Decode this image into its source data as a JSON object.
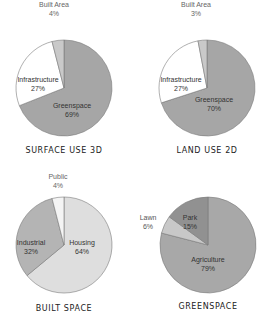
{
  "chart_data": [
    {
      "type": "pie",
      "title": "SURFACE USE 3D",
      "center": [
        64,
        88
      ],
      "radius": 48,
      "slices": [
        {
          "label": "Greenspace",
          "value": 69,
          "display": "69%",
          "color": "#a6a6a6",
          "label_pos": [
            72,
            108
          ],
          "label_color": "#333333"
        },
        {
          "label": "Infrastructure",
          "value": 27,
          "display": "27%",
          "color": "#ffffff",
          "label_pos": [
            38,
            82
          ],
          "label_color": "#333333"
        },
        {
          "label": "Built Area",
          "value": 4,
          "display": "4%",
          "color": "#c9c9c9",
          "label_pos": [
            54,
            7
          ],
          "label_color": "#666666"
        }
      ]
    },
    {
      "type": "pie",
      "title": "LAND USE 2D",
      "center": [
        207,
        88
      ],
      "radius": 48,
      "slices": [
        {
          "label": "Greenspace",
          "value": 70,
          "display": "70%",
          "color": "#a6a6a6",
          "label_pos": [
            214,
            102
          ],
          "label_color": "#333333"
        },
        {
          "label": "Infrastructure",
          "value": 27,
          "display": "27%",
          "color": "#ffffff",
          "label_pos": [
            181,
            82
          ],
          "label_color": "#333333"
        },
        {
          "label": "Built Area",
          "value": 3,
          "display": "3%",
          "color": "#c9c9c9",
          "label_pos": [
            196,
            7
          ],
          "label_color": "#666666"
        }
      ]
    },
    {
      "type": "pie",
      "title": "BUILT SPACE",
      "center": [
        64,
        245
      ],
      "radius": 48,
      "slices": [
        {
          "label": "Housing",
          "value": 64,
          "display": "64%",
          "color": "#dedede",
          "label_pos": [
            82,
            245
          ],
          "label_color": "#333333"
        },
        {
          "label": "Industrial",
          "value": 32,
          "display": "32%",
          "color": "#b4b4b4",
          "label_pos": [
            31,
            245
          ],
          "label_color": "#333333"
        },
        {
          "label": "Public",
          "value": 4,
          "display": "4%",
          "color": "#f4f4f4",
          "label_pos": [
            58,
            179
          ],
          "label_color": "#666666"
        }
      ]
    },
    {
      "type": "pie",
      "title": "GREENSPACE",
      "center": [
        208,
        245
      ],
      "radius": 48,
      "slices": [
        {
          "label": "Agriculture",
          "value": 79,
          "display": "79%",
          "color": "#a8a8a8",
          "label_pos": [
            208,
            262
          ],
          "label_color": "#333333"
        },
        {
          "label": "Lawn",
          "value": 6,
          "display": "6%",
          "color": "#c8c8c8",
          "label_pos": [
            148,
            220
          ],
          "label_color": "#555555"
        },
        {
          "label": "Park",
          "value": 15,
          "display": "15%",
          "color": "#919191",
          "label_pos": [
            190,
            220
          ],
          "label_color": "#333333"
        }
      ]
    }
  ],
  "titles": {
    "surface_use": "SURFACE USE 3D",
    "land_use": "LAND USE 2D",
    "built_space": "BUILT SPACE",
    "greenspace": "GREENSPACE"
  }
}
